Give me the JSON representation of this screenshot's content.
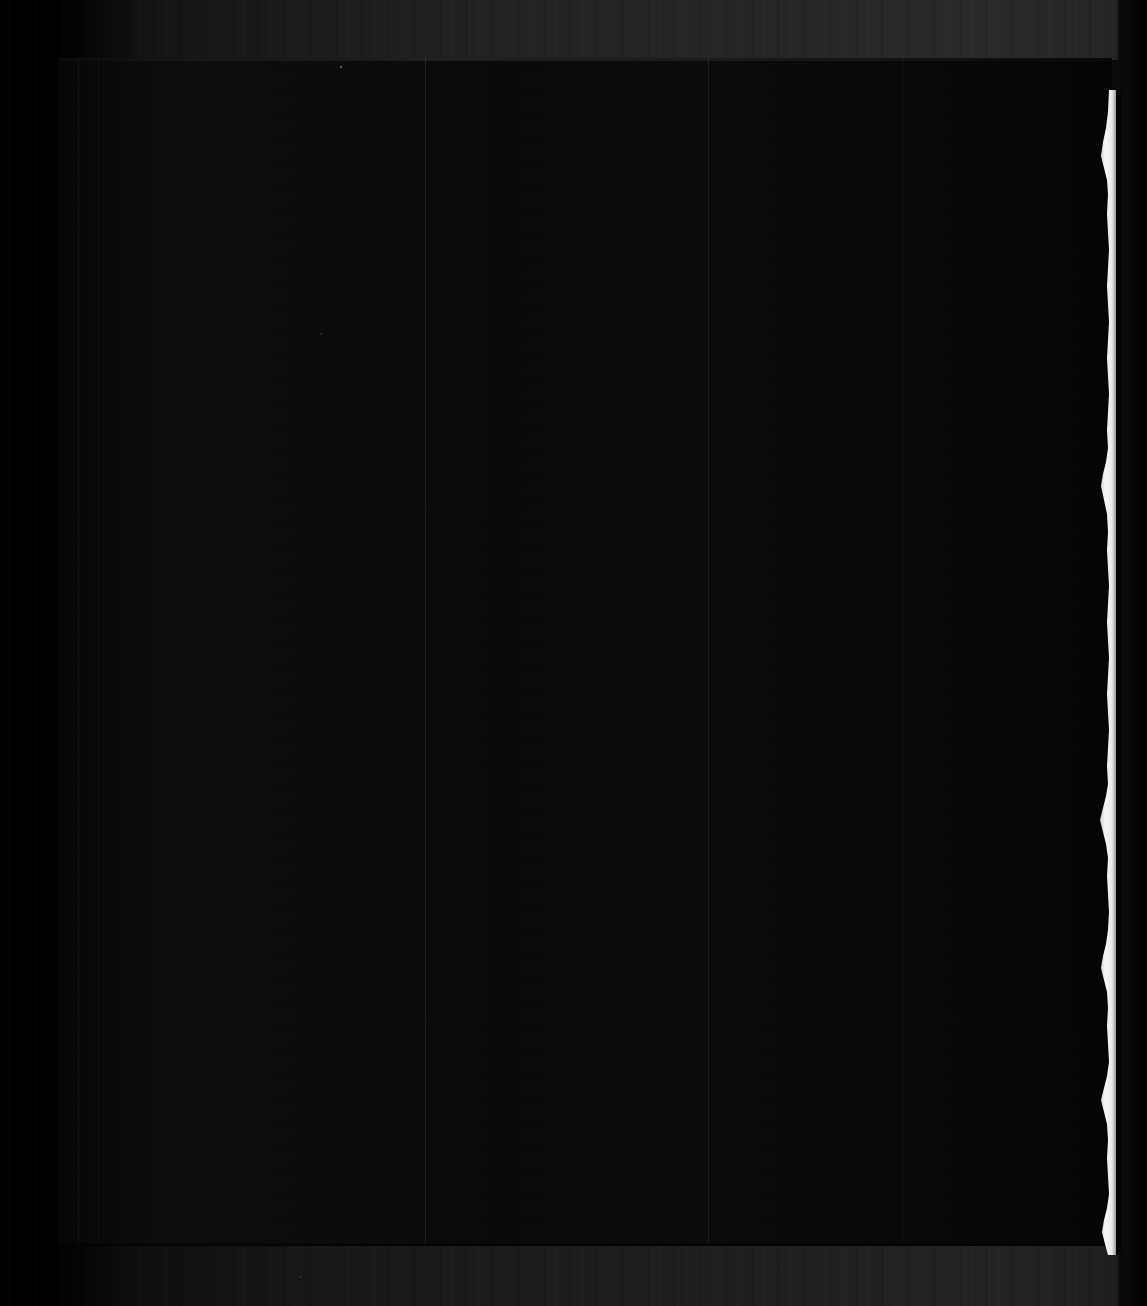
{
  "document": {
    "title": "Scanned page (underexposed)",
    "page_label": "",
    "visible_text": "",
    "note": ""
  },
  "scan": {
    "width_px": 1147,
    "height_px": 1306,
    "page_left_px": 58,
    "page_top_px": 58,
    "page_width_px": 1054,
    "page_height_px": 1188,
    "orientation": "portrait",
    "tone": "near-black"
  },
  "colors": {
    "page_fill": "#080808",
    "bed_background": "#1f1f1f",
    "void_black": "#000000",
    "torn_edge_white": "#f2f2f2",
    "seam_line": "#2a2a2a"
  },
  "regions": [
    {
      "name": "scanner-bed-top",
      "label": "Scanner background above page"
    },
    {
      "name": "scanner-bed-bottom",
      "label": "Scanner background below page"
    },
    {
      "name": "scanner-void-left",
      "label": "Black void left of page"
    },
    {
      "name": "scanner-void-right",
      "label": "Black void right of page"
    },
    {
      "name": "page-body",
      "label": "Document page area"
    },
    {
      "name": "torn-right-edge",
      "label": "Ragged white torn paper edge"
    }
  ],
  "seams": [
    {
      "name": "seam-left-1",
      "x_px": 78
    },
    {
      "name": "seam-left-2",
      "x_px": 98
    },
    {
      "name": "seam-center-1",
      "x_px": 425
    },
    {
      "name": "seam-center-2",
      "x_px": 708
    },
    {
      "name": "seam-right-1",
      "x_px": 903
    }
  ],
  "specks": [
    {
      "name": "speck-a",
      "x_px": 340,
      "y_px": 66,
      "size_px": 2
    },
    {
      "name": "speck-b",
      "x_px": 320,
      "y_px": 333,
      "size_px": 2
    },
    {
      "name": "speck-c",
      "x_px": 300,
      "y_px": 1276,
      "size_px": 2
    }
  ]
}
